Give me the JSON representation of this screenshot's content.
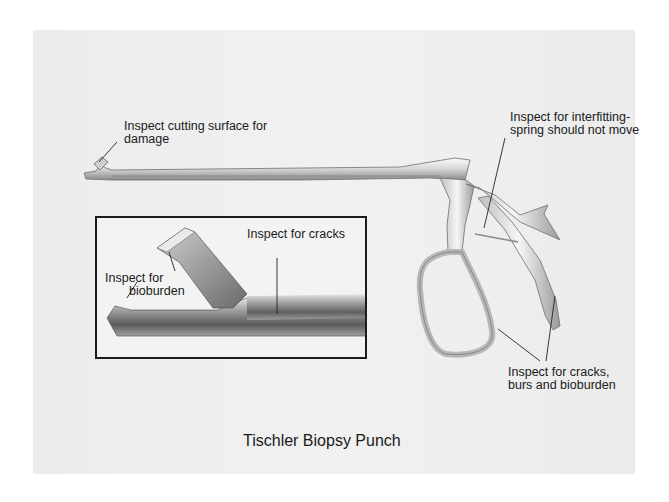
{
  "figure": {
    "title": "Tischler Biopsy Punch"
  },
  "callouts": {
    "cutting_surface": {
      "line1": "Inspect cutting surface for",
      "line2": "damage"
    },
    "interfitting": {
      "line1": "Inspect for interfitting-",
      "line2": "spring should not move"
    },
    "cracks_burs": {
      "line1": "Inspect for cracks,",
      "line2": "burs and bioburden"
    }
  },
  "inset": {
    "cracks": "Inspect for cracks",
    "bioburden": {
      "line1": "Inspect for",
      "line2": "bioburden"
    }
  },
  "colors": {
    "panel": "#eeeeee",
    "text": "#1a1a1a",
    "metal_light": "#f4f4f4",
    "metal_dark": "#7a7a7a",
    "border": "#1c1c1c"
  }
}
